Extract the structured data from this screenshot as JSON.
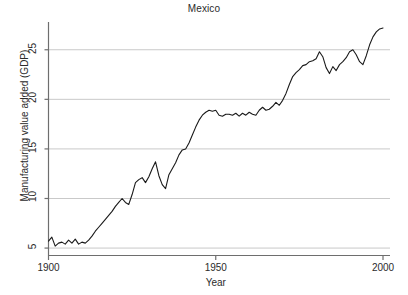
{
  "chart_data": {
    "type": "line",
    "title": "Mexico",
    "xlabel": "Year",
    "ylabel": "Manufacturing value added (GDP)",
    "xlim": [
      1900,
      2000
    ],
    "ylim": [
      4.2,
      27.8
    ],
    "xticks": [
      1900,
      1950,
      2000
    ],
    "yticks": [
      5,
      10,
      15,
      20,
      25
    ],
    "grid": "horizontal",
    "legend": "none",
    "line_color": "#1a1a1a",
    "grid_color": "#c9c9c9",
    "axis_color": "#6e6e6e",
    "series": [
      {
        "name": "Manufacturing value added (GDP)",
        "x": [
          1900,
          1901,
          1902,
          1903,
          1904,
          1905,
          1906,
          1907,
          1908,
          1909,
          1910,
          1911,
          1912,
          1913,
          1914,
          1915,
          1916,
          1917,
          1918,
          1919,
          1920,
          1921,
          1922,
          1923,
          1924,
          1925,
          1926,
          1927,
          1928,
          1929,
          1930,
          1931,
          1932,
          1933,
          1934,
          1935,
          1936,
          1937,
          1938,
          1939,
          1940,
          1941,
          1942,
          1943,
          1944,
          1945,
          1946,
          1947,
          1948,
          1949,
          1950,
          1951,
          1952,
          1953,
          1954,
          1955,
          1956,
          1957,
          1958,
          1959,
          1960,
          1961,
          1962,
          1963,
          1964,
          1965,
          1966,
          1967,
          1968,
          1969,
          1970,
          1971,
          1972,
          1973,
          1974,
          1975,
          1976,
          1977,
          1978,
          1979,
          1980,
          1981,
          1982,
          1983,
          1984,
          1985,
          1986,
          1987,
          1988,
          1989,
          1990,
          1991,
          1992,
          1993,
          1994,
          1995,
          1996,
          1997,
          1998,
          1999,
          2000
        ],
        "values": [
          5.7,
          6.1,
          5.2,
          5.5,
          5.6,
          5.4,
          5.8,
          5.5,
          5.9,
          5.4,
          5.6,
          5.5,
          5.8,
          6.2,
          6.7,
          7.1,
          7.5,
          7.9,
          8.3,
          8.7,
          9.2,
          9.6,
          10.0,
          9.6,
          9.4,
          10.4,
          11.6,
          11.9,
          12.1,
          11.6,
          12.2,
          13.0,
          13.7,
          12.3,
          11.4,
          11.0,
          12.4,
          13.0,
          13.6,
          14.4,
          14.9,
          15.0,
          15.6,
          16.4,
          17.2,
          17.9,
          18.4,
          18.7,
          18.9,
          18.8,
          18.9,
          18.4,
          18.3,
          18.5,
          18.5,
          18.4,
          18.6,
          18.3,
          18.6,
          18.4,
          18.7,
          18.5,
          18.4,
          18.9,
          19.2,
          18.9,
          19.0,
          19.3,
          19.7,
          19.4,
          19.9,
          20.6,
          21.5,
          22.3,
          22.7,
          23.0,
          23.4,
          23.5,
          23.8,
          23.9,
          24.1,
          24.8,
          24.3,
          23.2,
          22.6,
          23.3,
          22.9,
          23.5,
          23.8,
          24.2,
          24.8,
          25.0,
          24.5,
          23.8,
          23.5,
          24.4,
          25.5,
          26.3,
          26.8,
          27.1,
          27.2
        ]
      }
    ]
  },
  "axis": {
    "ytick_labels": [
      "5",
      "10",
      "15",
      "20",
      "25"
    ],
    "xtick_labels": [
      "1900",
      "1950",
      "2000"
    ]
  }
}
